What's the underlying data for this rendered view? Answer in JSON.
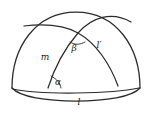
{
  "figure": {
    "colors": {
      "stroke": "#2b2b2b",
      "label": "#1a1a1a",
      "background": "#ffffff"
    },
    "labels": [
      {
        "id": "m",
        "text": "m",
        "x": 45,
        "y": 60,
        "kind": "latin-italic"
      },
      {
        "id": "beta",
        "text": "β",
        "x": 74,
        "y": 47,
        "kind": "greek-italic"
      },
      {
        "id": "l-prime",
        "text": "l′",
        "x": 99,
        "y": 48,
        "kind": "latin-italic"
      },
      {
        "id": "alpha",
        "text": "α",
        "x": 58,
        "y": 84,
        "kind": "greek-italic"
      },
      {
        "id": "l",
        "text": "l",
        "x": 79,
        "y": 103,
        "kind": "latin-italic"
      }
    ],
    "geometry": {
      "dome_top_y": 12,
      "base_y": 89,
      "left_x": 12,
      "right_x": 140,
      "crossing_point": {
        "x": 78,
        "y": 33
      },
      "alpha_vertex": {
        "x": 48,
        "y": 88
      },
      "alpha_arc_radius": 13,
      "beta_arc_radius": 11
    }
  }
}
